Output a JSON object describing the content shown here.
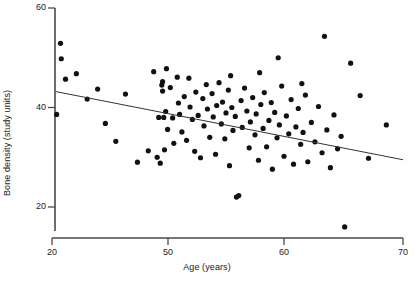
{
  "chart_data": {
    "type": "scatter",
    "title": "",
    "xlabel": "Age (years)",
    "ylabel": "Bone density (study units)",
    "xticks": [
      20,
      50,
      60,
      70
    ],
    "xtick_labels": [
      "20",
      "50",
      "60",
      "70"
    ],
    "yticks": [
      20,
      40,
      60
    ],
    "ytick_labels": [
      "20",
      "40",
      "60"
    ],
    "xlim": [
      20,
      70
    ],
    "ylim": [
      15,
      60
    ],
    "x_axis_broken": true,
    "x_axis_note": "axis break between 20 and 50; tick spacing is uniform in pixels",
    "grid": false,
    "legend": null,
    "marker": {
      "shape": "circle",
      "color": "#111111",
      "size_px": 3.4
    },
    "trendline": {
      "type": "linear-regression",
      "color": "#333333",
      "width_px": 1,
      "x_start": 21.0,
      "y_start": 43.2,
      "x_end": 70.0,
      "y_end": 29.5
    },
    "points": [
      [
        21.2,
        38.6
      ],
      [
        22.2,
        52.9
      ],
      [
        22.4,
        49.8
      ],
      [
        23.5,
        45.7
      ],
      [
        26.3,
        46.8
      ],
      [
        29.1,
        41.7
      ],
      [
        31.8,
        43.7
      ],
      [
        33.8,
        36.8
      ],
      [
        36.5,
        33.2
      ],
      [
        39.0,
        42.7
      ],
      [
        42.1,
        29.0
      ],
      [
        44.9,
        31.3
      ],
      [
        46.3,
        47.2
      ],
      [
        47.2,
        30.0
      ],
      [
        47.6,
        38.0
      ],
      [
        48.0,
        28.8
      ],
      [
        48.4,
        44.5
      ],
      [
        48.6,
        45.2
      ],
      [
        48.6,
        43.3
      ],
      [
        48.9,
        38.0
      ],
      [
        49.1,
        31.5
      ],
      [
        49.4,
        39.2
      ],
      [
        49.6,
        47.8
      ],
      [
        49.9,
        35.6
      ],
      [
        50.2,
        44.0
      ],
      [
        50.4,
        37.9
      ],
      [
        50.5,
        32.8
      ],
      [
        50.8,
        46.1
      ],
      [
        50.9,
        40.9
      ],
      [
        51.0,
        38.6
      ],
      [
        51.2,
        35.1
      ],
      [
        51.4,
        42.2
      ],
      [
        51.6,
        33.4
      ],
      [
        51.8,
        45.9
      ],
      [
        51.9,
        40.1
      ],
      [
        52.1,
        37.6
      ],
      [
        52.3,
        31.2
      ],
      [
        52.4,
        43.1
      ],
      [
        52.6,
        38.4
      ],
      [
        52.8,
        29.9
      ],
      [
        53.0,
        41.8
      ],
      [
        53.1,
        36.3
      ],
      [
        53.3,
        44.6
      ],
      [
        53.4,
        39.7
      ],
      [
        53.6,
        34.0
      ],
      [
        53.8,
        42.8
      ],
      [
        53.9,
        38.1
      ],
      [
        54.1,
        30.6
      ],
      [
        54.2,
        40.4
      ],
      [
        54.4,
        45.0
      ],
      [
        54.6,
        36.7
      ],
      [
        54.7,
        41.1
      ],
      [
        54.9,
        33.7
      ],
      [
        55.0,
        38.9
      ],
      [
        55.2,
        43.5
      ],
      [
        55.3,
        28.3
      ],
      [
        55.5,
        40.0
      ],
      [
        55.6,
        35.4
      ],
      [
        55.8,
        38.2
      ],
      [
        55.9,
        22.0
      ],
      [
        56.1,
        22.3
      ],
      [
        56.3,
        41.4
      ],
      [
        56.4,
        36.0
      ],
      [
        56.6,
        43.9
      ],
      [
        56.8,
        39.3
      ],
      [
        57.0,
        31.9
      ],
      [
        57.1,
        37.1
      ],
      [
        57.3,
        42.0
      ],
      [
        57.5,
        34.5
      ],
      [
        57.6,
        38.7
      ],
      [
        57.8,
        29.4
      ],
      [
        58.0,
        40.6
      ],
      [
        58.2,
        35.8
      ],
      [
        58.3,
        43.0
      ],
      [
        58.5,
        32.1
      ],
      [
        58.7,
        37.4
      ],
      [
        58.9,
        41.0
      ],
      [
        59.0,
        27.6
      ],
      [
        59.2,
        39.0
      ],
      [
        59.4,
        33.9
      ],
      [
        59.6,
        36.5
      ],
      [
        59.8,
        44.3
      ],
      [
        60.0,
        30.2
      ],
      [
        60.2,
        38.3
      ],
      [
        60.4,
        34.7
      ],
      [
        60.6,
        41.6
      ],
      [
        60.8,
        28.6
      ],
      [
        61.0,
        36.1
      ],
      [
        61.2,
        39.8
      ],
      [
        61.4,
        32.6
      ],
      [
        61.6,
        35.0
      ],
      [
        61.8,
        42.5
      ],
      [
        62.0,
        29.1
      ],
      [
        62.3,
        37.0
      ],
      [
        62.6,
        33.1
      ],
      [
        62.9,
        40.2
      ],
      [
        63.2,
        30.9
      ],
      [
        63.4,
        54.3
      ],
      [
        63.6,
        35.5
      ],
      [
        63.9,
        27.9
      ],
      [
        64.2,
        38.5
      ],
      [
        64.5,
        31.7
      ],
      [
        64.8,
        34.2
      ],
      [
        65.1,
        16.0
      ],
      [
        65.6,
        48.9
      ],
      [
        66.4,
        42.4
      ],
      [
        67.1,
        29.8
      ],
      [
        68.6,
        36.5
      ],
      [
        55.4,
        46.4
      ],
      [
        57.9,
        47.0
      ],
      [
        59.5,
        50.0
      ],
      [
        61.5,
        44.8
      ]
    ]
  }
}
